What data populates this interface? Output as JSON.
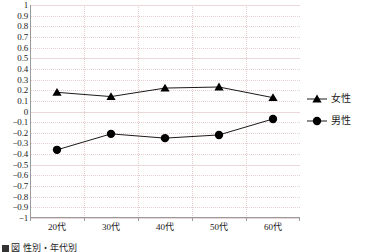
{
  "chart_data": {
    "type": "line",
    "title": "",
    "subtitle": "",
    "xlabel": "",
    "ylabel": "",
    "categories": [
      "20代",
      "30代",
      "40代",
      "50代",
      "60代"
    ],
    "series": [
      {
        "name": "女性",
        "marker": "triangle",
        "color": "#000000",
        "values": [
          0.18,
          0.14,
          0.22,
          0.23,
          0.13
        ]
      },
      {
        "name": "男性",
        "marker": "circle",
        "color": "#000000",
        "values": [
          -0.36,
          -0.21,
          -0.25,
          -0.22,
          -0.07
        ]
      }
    ],
    "ylim": [
      -1,
      1
    ],
    "ytick_step": 0.1,
    "ytick_labels": [
      "1",
      "0.9",
      "0.8",
      "0.7",
      "0.6",
      "0.5",
      "0.4",
      "0.3",
      "0.2",
      "0.1",
      "0",
      "−0.1",
      "−0.2",
      "−0.3",
      "−0.4",
      "−0.5",
      "−0.6",
      "−0.7",
      "−0.8",
      "−0.9",
      "−1"
    ],
    "ytick_values": [
      1,
      0.9,
      0.8,
      0.7,
      0.6,
      0.5,
      0.4,
      0.3,
      0.2,
      0.1,
      0,
      -0.1,
      -0.2,
      -0.3,
      -0.4,
      -0.5,
      -0.6,
      -0.7,
      -0.8,
      -0.9,
      -1
    ],
    "grid": true,
    "grid_color": "#e8cfcf",
    "axis_color": "#9a9a9a",
    "legend_position": "right"
  },
  "legend": {
    "entries": [
      {
        "label": "女性",
        "marker": "triangle"
      },
      {
        "label": "男性",
        "marker": "circle"
      }
    ]
  },
  "caption": {
    "text": "図 性別・年代別"
  }
}
